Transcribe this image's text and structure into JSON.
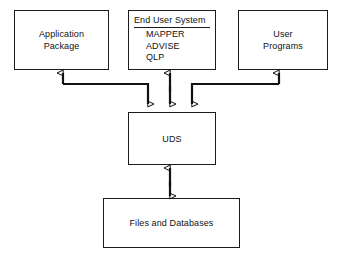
{
  "diagram": {
    "type": "block-flow-diagram",
    "nodes": [
      {
        "id": "application-package",
        "label": "Application\nPackage",
        "x": 14,
        "y": 10,
        "w": 95,
        "h": 60
      },
      {
        "id": "end-user-system",
        "header": "End User System",
        "items": [
          "MAPPER",
          "ADVISE",
          "QLP"
        ],
        "x": 128,
        "y": 10,
        "w": 88,
        "h": 60
      },
      {
        "id": "user-programs",
        "label": "User\nPrograms",
        "x": 238,
        "y": 10,
        "w": 90,
        "h": 60
      },
      {
        "id": "uds",
        "label": "UDS",
        "x": 128,
        "y": 112,
        "w": 88,
        "h": 53
      },
      {
        "id": "files-and-databases",
        "label": "Files and Databases",
        "x": 103,
        "y": 198,
        "w": 137,
        "h": 50
      }
    ],
    "connectors": [
      {
        "id": "application-package-to-uds",
        "from": "application-package",
        "to": "uds",
        "direction": "bidirectional-routed",
        "arrowheads": [
          "up-into-application-package",
          "down-into-uds"
        ]
      },
      {
        "id": "end-user-system-to-uds",
        "from": "end-user-system",
        "to": "uds",
        "direction": "bidirectional",
        "arrowheads": [
          "up-into-end-user-system",
          "down-into-uds"
        ]
      },
      {
        "id": "user-programs-to-uds",
        "from": "user-programs",
        "to": "uds",
        "direction": "bidirectional-routed",
        "arrowheads": [
          "up-into-user-programs",
          "down-into-uds"
        ]
      },
      {
        "id": "uds-to-files-and-databases",
        "from": "uds",
        "to": "files-and-databases",
        "direction": "bidirectional",
        "arrowheads": [
          "up-into-uds",
          "down-into-files-and-databases"
        ]
      }
    ],
    "colors": {
      "stroke": "#111111",
      "background": "#ffffff",
      "text": "#111111"
    }
  }
}
